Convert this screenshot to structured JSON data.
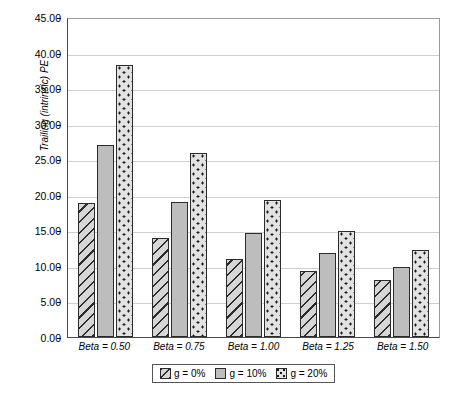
{
  "chart_data": {
    "type": "bar",
    "title": "",
    "xlabel": "",
    "ylabel": "Trailing (intrinsic) PE",
    "ylim": [
      0,
      45
    ],
    "ytick_step": 5,
    "ytick_labels": [
      "45.00",
      "40.00",
      "35.00",
      "30.00",
      "25.00",
      "20.00",
      "15.00",
      "10.00",
      "5.00",
      "0.00"
    ],
    "ytick_values": [
      45,
      40,
      35,
      30,
      25,
      20,
      15,
      10,
      5,
      0
    ],
    "categories": [
      "Beta = 0.50",
      "Beta = 0.75",
      "Beta = 1.00",
      "Beta = 1.25",
      "Beta = 1.50"
    ],
    "series": [
      {
        "name": "g = 0%",
        "pattern": "hatch",
        "values": [
          18.9,
          13.9,
          11.0,
          9.3,
          8.0
        ]
      },
      {
        "name": "g = 10%",
        "pattern": "solid",
        "values": [
          27.0,
          19.0,
          14.6,
          11.8,
          9.9
        ]
      },
      {
        "name": "g = 20%",
        "pattern": "dots",
        "values": [
          38.3,
          25.9,
          19.2,
          14.9,
          12.2
        ]
      }
    ],
    "grid": true,
    "legend_position": "bottom",
    "colors": {
      "hatch_fill": "#d6d6d6",
      "solid_fill": "#bdbdbd",
      "dots_fill": "#e2e2e2",
      "bar_border": "#2b2b2b",
      "gridline": "#cfcfcf",
      "axis": "#4a4a4a",
      "background": "#ffffff"
    }
  }
}
